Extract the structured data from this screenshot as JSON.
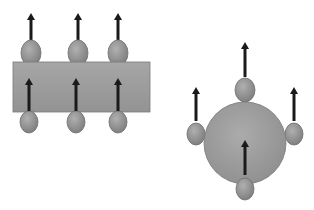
{
  "diagram": {
    "colors": {
      "background": "#ffffff",
      "shape_fill": "#9a9a9a",
      "shape_stroke": "#7a7a7a",
      "particle_fill": "#8e8e8e",
      "particle_stroke": "#6e6e6e",
      "arrow": "#1a1a1a"
    },
    "left_figure": {
      "shape": "rectangle",
      "rect": {
        "x": 13,
        "y": 62,
        "width": 137,
        "height": 50
      },
      "top_particles": [
        {
          "cx": 31,
          "cy": 53,
          "rx": 10,
          "ry": 13,
          "arrow": {
            "x": 31,
            "y1": 40,
            "y2": 13
          }
        },
        {
          "cx": 78,
          "cy": 53,
          "rx": 10,
          "ry": 13,
          "arrow": {
            "x": 78,
            "y1": 40,
            "y2": 13
          }
        },
        {
          "cx": 118,
          "cy": 53,
          "rx": 10,
          "ry": 13,
          "arrow": {
            "x": 118,
            "y1": 40,
            "y2": 13
          }
        }
      ],
      "bottom_particles": [
        {
          "cx": 29,
          "cy": 122,
          "rx": 9,
          "ry": 11,
          "arrow": {
            "x": 29,
            "y1": 111,
            "y2": 78
          }
        },
        {
          "cx": 76,
          "cy": 122,
          "rx": 9,
          "ry": 11,
          "arrow": {
            "x": 76,
            "y1": 111,
            "y2": 78
          }
        },
        {
          "cx": 118,
          "cy": 122,
          "rx": 9,
          "ry": 11,
          "arrow": {
            "x": 118,
            "y1": 111,
            "y2": 78
          }
        }
      ]
    },
    "right_figure": {
      "shape": "circle",
      "circle": {
        "cx": 245,
        "cy": 143,
        "r": 41
      },
      "particles": [
        {
          "name": "top",
          "cx": 245,
          "cy": 90,
          "rx": 10,
          "ry": 12,
          "arrow": {
            "x": 245,
            "y1": 77,
            "y2": 42
          }
        },
        {
          "name": "left",
          "cx": 196,
          "cy": 134,
          "rx": 9,
          "ry": 11,
          "arrow": {
            "x": 196,
            "y1": 121,
            "y2": 87
          }
        },
        {
          "name": "right",
          "cx": 294,
          "cy": 134,
          "rx": 9,
          "ry": 11,
          "arrow": {
            "x": 294,
            "y1": 121,
            "y2": 87
          }
        },
        {
          "name": "bottom",
          "cx": 245,
          "cy": 189,
          "rx": 9,
          "ry": 11,
          "arrow": {
            "x": 245,
            "y1": 175,
            "y2": 140
          }
        }
      ]
    }
  }
}
